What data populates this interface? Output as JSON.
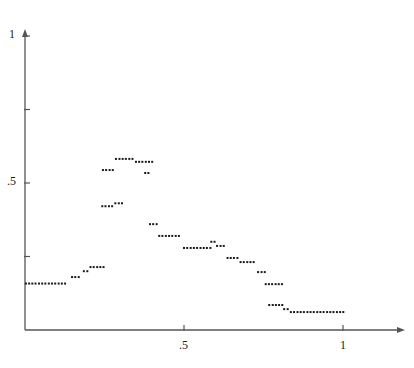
{
  "chart_data": {
    "type": "scatter",
    "title": "",
    "subtitle": "",
    "xlabel": "",
    "ylabel": "",
    "xlim": [
      0,
      1.22
    ],
    "ylim": [
      0,
      1.0
    ],
    "grid": false,
    "legend": null,
    "marker": {
      "shape": "square",
      "size_px": 2,
      "color": "#1a1a1a"
    },
    "axes": {
      "x": {
        "tick_values": [
          0.5,
          1
        ],
        "tick_labels": [
          ".5",
          "1"
        ],
        "minor_ticks": [],
        "arrow": true,
        "axis_color": "#555555"
      },
      "y": {
        "tick_values": [
          0.25,
          0.5,
          0.75,
          1
        ],
        "tick_labels": [
          "",
          ".5",
          "",
          "1"
        ],
        "labeled_ticks": [
          {
            "value": 0.5,
            "label": ".5"
          },
          {
            "value": 1,
            "label": "1"
          }
        ],
        "arrow": true,
        "axis_color": "#555555"
      }
    },
    "series": [
      {
        "name": "series-1",
        "n_points": 131,
        "description": "step-like curve rising from a low plateau to a peak near x=0.38 then descending in plateaus to the right",
        "points": [
          [
            0.003,
            0.158
          ],
          [
            0.013,
            0.158
          ],
          [
            0.023,
            0.158
          ],
          [
            0.033,
            0.158
          ],
          [
            0.044,
            0.158
          ],
          [
            0.054,
            0.158
          ],
          [
            0.064,
            0.158
          ],
          [
            0.075,
            0.158
          ],
          [
            0.085,
            0.158
          ],
          [
            0.095,
            0.158
          ],
          [
            0.106,
            0.158
          ],
          [
            0.116,
            0.158
          ],
          [
            0.126,
            0.158
          ],
          [
            0.148,
            0.18
          ],
          [
            0.158,
            0.18
          ],
          [
            0.169,
            0.18
          ],
          [
            0.185,
            0.2
          ],
          [
            0.196,
            0.2
          ],
          [
            0.206,
            0.214
          ],
          [
            0.216,
            0.214
          ],
          [
            0.227,
            0.214
          ],
          [
            0.237,
            0.214
          ],
          [
            0.247,
            0.214
          ],
          [
            0.243,
            0.421
          ],
          [
            0.253,
            0.421
          ],
          [
            0.264,
            0.421
          ],
          [
            0.274,
            0.421
          ],
          [
            0.284,
            0.431
          ],
          [
            0.295,
            0.431
          ],
          [
            0.305,
            0.431
          ],
          [
            0.245,
            0.544
          ],
          [
            0.255,
            0.544
          ],
          [
            0.266,
            0.544
          ],
          [
            0.276,
            0.544
          ],
          [
            0.286,
            0.582
          ],
          [
            0.297,
            0.582
          ],
          [
            0.307,
            0.582
          ],
          [
            0.317,
            0.582
          ],
          [
            0.328,
            0.582
          ],
          [
            0.338,
            0.582
          ],
          [
            0.349,
            0.572
          ],
          [
            0.359,
            0.572
          ],
          [
            0.369,
            0.572
          ],
          [
            0.38,
            0.572
          ],
          [
            0.39,
            0.572
          ],
          [
            0.4,
            0.572
          ],
          [
            0.378,
            0.534
          ],
          [
            0.388,
            0.534
          ],
          [
            0.393,
            0.36
          ],
          [
            0.403,
            0.36
          ],
          [
            0.414,
            0.36
          ],
          [
            0.422,
            0.32
          ],
          [
            0.432,
            0.32
          ],
          [
            0.443,
            0.32
          ],
          [
            0.453,
            0.32
          ],
          [
            0.463,
            0.32
          ],
          [
            0.474,
            0.32
          ],
          [
            0.484,
            0.32
          ],
          [
            0.5,
            0.279
          ],
          [
            0.51,
            0.279
          ],
          [
            0.521,
            0.279
          ],
          [
            0.531,
            0.279
          ],
          [
            0.541,
            0.279
          ],
          [
            0.552,
            0.279
          ],
          [
            0.562,
            0.279
          ],
          [
            0.572,
            0.279
          ],
          [
            0.583,
            0.279
          ],
          [
            0.586,
            0.3
          ],
          [
            0.596,
            0.3
          ],
          [
            0.604,
            0.286
          ],
          [
            0.615,
            0.286
          ],
          [
            0.625,
            0.286
          ],
          [
            0.637,
            0.245
          ],
          [
            0.647,
            0.245
          ],
          [
            0.657,
            0.245
          ],
          [
            0.668,
            0.245
          ],
          [
            0.678,
            0.231
          ],
          [
            0.688,
            0.231
          ],
          [
            0.699,
            0.231
          ],
          [
            0.709,
            0.231
          ],
          [
            0.719,
            0.231
          ],
          [
            0.733,
            0.197
          ],
          [
            0.744,
            0.197
          ],
          [
            0.754,
            0.197
          ],
          [
            0.757,
            0.156
          ],
          [
            0.767,
            0.156
          ],
          [
            0.777,
            0.156
          ],
          [
            0.788,
            0.156
          ],
          [
            0.798,
            0.156
          ],
          [
            0.808,
            0.156
          ],
          [
            0.768,
            0.085
          ],
          [
            0.779,
            0.085
          ],
          [
            0.789,
            0.085
          ],
          [
            0.799,
            0.085
          ],
          [
            0.809,
            0.085
          ],
          [
            0.815,
            0.071
          ],
          [
            0.826,
            0.071
          ],
          [
            0.836,
            0.061
          ],
          [
            0.846,
            0.061
          ],
          [
            0.857,
            0.061
          ],
          [
            0.867,
            0.061
          ],
          [
            0.877,
            0.061
          ],
          [
            0.888,
            0.061
          ],
          [
            0.898,
            0.061
          ],
          [
            0.908,
            0.061
          ],
          [
            0.919,
            0.061
          ],
          [
            0.929,
            0.061
          ],
          [
            0.939,
            0.061
          ],
          [
            0.95,
            0.061
          ],
          [
            0.96,
            0.061
          ],
          [
            0.97,
            0.061
          ],
          [
            0.981,
            0.061
          ],
          [
            0.991,
            0.061
          ],
          [
            1.001,
            0.061
          ]
        ]
      }
    ]
  },
  "geometry": {
    "origin_px": {
      "x": 25,
      "y": 330
    },
    "x_unit_px": 318,
    "y_unit_px": 294,
    "x_axis_end_px": 400,
    "y_axis_top_px": 34
  },
  "labels": {
    "y_top": "1",
    "y_mid": ".5",
    "x_mid": ".5",
    "x_right": "1"
  }
}
